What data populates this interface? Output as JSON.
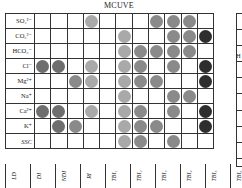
{
  "chart_data": {
    "type": "heatmap",
    "title": "MCUVE",
    "rows": [
      "SO4²⁻",
      "CO3²⁻",
      "HCO3⁻",
      "Cl⁻",
      "Mg²⁺",
      "Na⁺",
      "Ca²⁺",
      "K⁺",
      "SSC"
    ],
    "columns": [
      "LD",
      "DI",
      "NDI",
      "RI",
      "TBI1",
      "TBI2",
      "TBI3",
      "TBI4",
      "TBI5",
      "TBI6",
      "TBI7"
    ],
    "legend": "circle shade indicates selection/importance level: 0 none, 1 light, 2 medium, 3 dark, 4 darkest",
    "values": [
      [
        0,
        0,
        0,
        1,
        0,
        0,
        0,
        2,
        2,
        2,
        0
      ],
      [
        0,
        0,
        0,
        0,
        0,
        1,
        0,
        0,
        2,
        2,
        4
      ],
      [
        0,
        0,
        0,
        0,
        0,
        1,
        2,
        2,
        2,
        2,
        0
      ],
      [
        3,
        3,
        0,
        1,
        0,
        1,
        2,
        0,
        2,
        0,
        4
      ],
      [
        0,
        0,
        2,
        1,
        0,
        1,
        2,
        2,
        0,
        0,
        4
      ],
      [
        0,
        0,
        0,
        0,
        0,
        1,
        0,
        0,
        2,
        2,
        0
      ],
      [
        3,
        3,
        0,
        1,
        0,
        1,
        2,
        0,
        2,
        0,
        4
      ],
      [
        0,
        3,
        2,
        0,
        0,
        1,
        2,
        2,
        0,
        0,
        4
      ],
      [
        0,
        0,
        0,
        0,
        0,
        1,
        2,
        0,
        2,
        0,
        0
      ]
    ],
    "colors": {
      "1": "#a9a9a9",
      "2": "#8a8a8a",
      "3": "#6e6e6e",
      "4": "#2e2e2e"
    }
  },
  "labels": {
    "title": "MCUVE",
    "rows": [
      "SO₄²⁻",
      "CO₃²⁻",
      "HCO₃⁻",
      "Cl⁻",
      "Mg²⁺",
      "Na⁺",
      "Ca²⁺",
      "K⁺",
      "SSC"
    ],
    "columns": [
      "LD",
      "DI",
      "NDI",
      "RI",
      "TBI₁",
      "TBI₂",
      "TBI₃",
      "TBI₄",
      "TBI₅",
      "TBI₆",
      "TBI₇"
    ],
    "panel2_partial_label": "H"
  }
}
